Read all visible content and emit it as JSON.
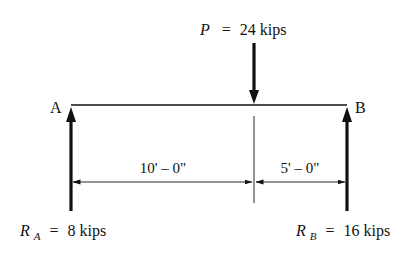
{
  "diagram": {
    "type": "simply-supported-beam-free-body",
    "colors": {
      "ink": "#111111",
      "background": "#ffffff"
    },
    "load": {
      "symbol": "P",
      "equals": "=",
      "value": "24 kips"
    },
    "supports": {
      "left": {
        "label": "A"
      },
      "right": {
        "label": "B"
      }
    },
    "dimensions": {
      "left_span": "10' – 0\"",
      "right_span": "5' – 0\""
    },
    "reactions": {
      "left": {
        "symbol": "R",
        "subscript": "A",
        "equals": "=",
        "value": "8 kips"
      },
      "right": {
        "symbol": "R",
        "subscript": "B",
        "equals": "=",
        "value": "16 kips"
      }
    }
  }
}
